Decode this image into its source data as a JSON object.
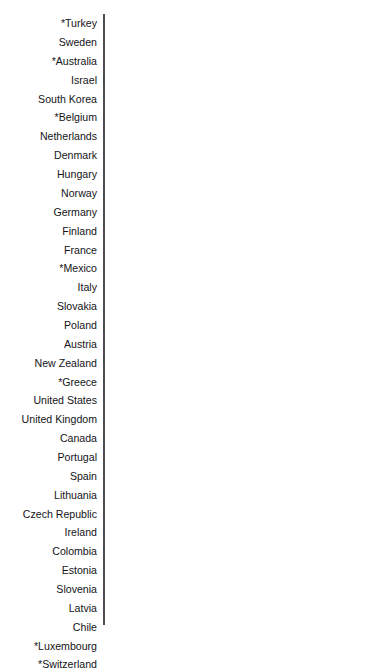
{
  "chart_data": {
    "type": "bar",
    "orientation": "horizontal",
    "title": "Voter turnout in national elections across the OECD",
    "xlabel": "",
    "ylabel": "",
    "xlim": [
      0,
      89
    ],
    "grid": false,
    "legend": false,
    "value_suffix_first": "%",
    "colors": {
      "bar": "#8f4ba3",
      "highlight": "#e8641d",
      "axis": "#4c4a52",
      "label_text": "#141418",
      "value_text": "#ffffff",
      "background": "#ffffff"
    },
    "highlight_category": "United States",
    "categories": [
      "*Turkey",
      "Sweden",
      "*Australia",
      "Israel",
      "South Korea",
      "*Belgium",
      "Netherlands",
      "Denmark",
      "Hungary",
      "Norway",
      "Germany",
      "Finland",
      "France",
      "*Mexico",
      "Italy",
      "Slovakia",
      "Poland",
      "Austria",
      "New Zealand",
      "*Greece",
      "United States",
      "United Kingdom",
      "Canada",
      "Portugal",
      "Spain",
      "Lithuania",
      "Czech Republic",
      "Ireland",
      "Colombia",
      "Estonia",
      "Slovenia",
      "Latvia",
      "Chile",
      "*Luxembourg",
      "*Switzerland"
    ],
    "values": [
      89,
      82,
      81,
      78,
      78,
      78,
      77,
      76,
      72,
      71,
      69,
      69,
      68,
      66,
      65,
      65,
      65,
      64,
      63,
      63,
      62,
      62,
      62,
      61,
      60,
      59,
      58,
      57,
      57,
      56,
      55,
      54,
      52,
      48,
      36
    ],
    "value_labels": [
      "89%",
      "82",
      "81",
      "78",
      "78",
      "78",
      "77",
      "76",
      "72",
      "71",
      "69",
      "69",
      "68",
      "66",
      "65",
      "65",
      "65",
      "64",
      "63",
      "63",
      "62",
      "62",
      "62",
      "61",
      "60",
      "59",
      "58",
      "57",
      "57",
      "56",
      "55",
      "54",
      "52",
      "48",
      "36"
    ]
  }
}
